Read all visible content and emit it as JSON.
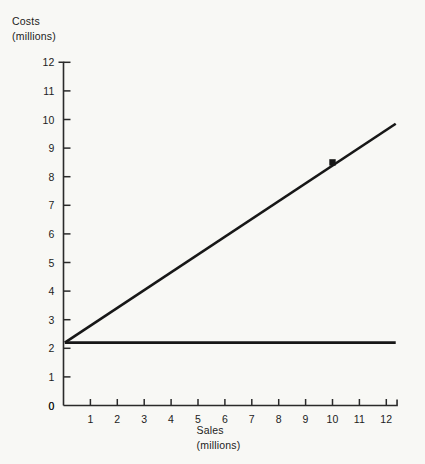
{
  "labels": {
    "y_axis_line1": "Costs",
    "y_axis_line2": "(millions)",
    "x_axis_line1": "Sales",
    "x_axis_line2": "(millions)"
  },
  "colors": {
    "background": "#f8f8f5",
    "axis": "#2a2a2a",
    "line": "#171717",
    "text": "#1c1c1c"
  },
  "chart_data": {
    "type": "line",
    "title": "",
    "xlabel": "Sales (millions)",
    "ylabel": "Costs (millions)",
    "xlim": [
      0,
      12.4
    ],
    "ylim": [
      0,
      12
    ],
    "xticks": [
      0,
      1,
      2,
      3,
      4,
      5,
      6,
      7,
      8,
      9,
      10,
      11,
      12
    ],
    "yticks": [
      0,
      1,
      2,
      3,
      4,
      5,
      6,
      7,
      8,
      9,
      10,
      11,
      12
    ],
    "xticklabels": [
      "0",
      "1",
      "2",
      "3",
      "4",
      "5",
      "6",
      "7",
      "8",
      "9",
      "10",
      "11",
      "12"
    ],
    "yticklabels": [
      "0",
      "1",
      "2",
      "3",
      "4",
      "5",
      "6",
      "7",
      "8",
      "9",
      "10",
      "11",
      "12"
    ],
    "grid": false,
    "legend": false,
    "series": [
      {
        "name": "Total costs",
        "x": [
          0.05,
          12.35
        ],
        "values": [
          2.2,
          9.85
        ],
        "markers": [
          {
            "x": 10,
            "y": 8.5
          }
        ]
      },
      {
        "name": "Fixed costs",
        "x": [
          0.05,
          12.35
        ],
        "values": [
          2.2,
          2.2
        ],
        "markers": []
      }
    ]
  }
}
